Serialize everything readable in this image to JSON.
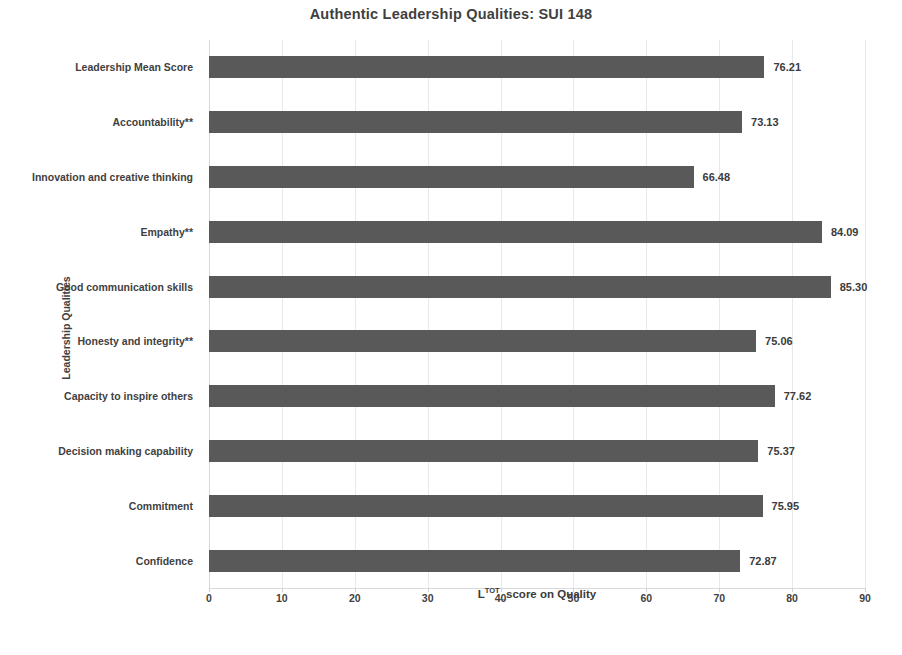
{
  "chart_data": {
    "type": "bar",
    "orientation": "horizontal",
    "title": "Authentic Leadership Qualities: SUI 148",
    "xlabel": "Lᵀᴼᵀ_score on Quality",
    "xlabel_base": "L",
    "xlabel_sup": "TOT",
    "xlabel_rest": "_score on Quality",
    "ylabel": "Leadership Qualities",
    "categories": [
      "Leadership Mean Score",
      "Accountability**",
      "Innovation and creative thinking",
      "Empathy**",
      "Good communication skills",
      "Honesty and integrity**",
      "Capacity to inspire others",
      "Decision making capability",
      "Commitment",
      "Confidence"
    ],
    "values": [
      76.21,
      73.13,
      66.48,
      84.09,
      85.3,
      75.06,
      77.62,
      75.37,
      75.95,
      72.87
    ],
    "value_labels": [
      "76.21",
      "73.13",
      "66.48",
      "84.09",
      "85.30",
      "75.06",
      "77.62",
      "75.37",
      "75.95",
      "72.87"
    ],
    "xlim": [
      0,
      90
    ],
    "xticks": [
      0,
      10,
      20,
      30,
      40,
      50,
      60,
      70,
      80,
      90
    ],
    "xtick_labels": [
      "0",
      "10",
      "20",
      "30",
      "40",
      "50",
      "60",
      "70",
      "80",
      "90"
    ],
    "grid": "vertical-only",
    "legend": "none",
    "bar_color": "#595959",
    "gridline_color": "#e9e9e9",
    "text_color": "#3f3f3f",
    "background": "#ffffff"
  }
}
